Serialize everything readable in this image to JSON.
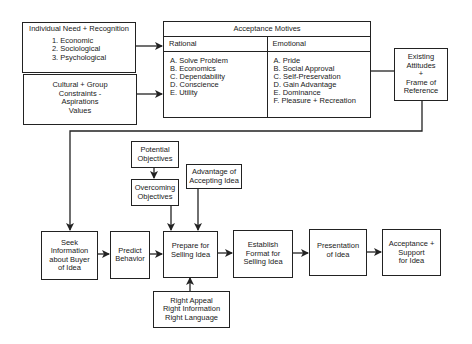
{
  "individual_need": {
    "title": "Individual Need + Recognition",
    "items": [
      "1.  Economic",
      "2.  Sociological",
      "3.  Psychological"
    ]
  },
  "cultural_group": {
    "lines": [
      "Cultural + Group",
      "Constraints -",
      "Aspirations",
      "Values"
    ]
  },
  "acceptance_motives": {
    "title": "Acceptance Motives",
    "rational": {
      "header": "Rational",
      "items": [
        "A.  Solve Problem",
        "B.  Economics",
        "C.  Dependability",
        "D.  Conscience",
        "E.  Utility"
      ]
    },
    "emotional": {
      "header": "Emotional",
      "items": [
        "A. Pride",
        "B. Social Approval",
        "C. Self-Preservation",
        "D. Gain Advantage",
        "E.  Dominance",
        "F.  Pleasure + Recreation"
      ]
    }
  },
  "existing_attitudes": {
    "lines": [
      "Existing",
      "Attitudes",
      "+",
      "Frame of",
      "Reference"
    ]
  },
  "potential_objectives": {
    "lines": [
      "Potential",
      "Objectives"
    ]
  },
  "overcoming_objectives": {
    "lines": [
      "Overcoming",
      "Objectives"
    ]
  },
  "advantage": {
    "lines": [
      "Advantage of",
      "Accepting Idea"
    ]
  },
  "flow": {
    "seek": [
      "Seek",
      "Information",
      "about Buyer",
      "of Idea"
    ],
    "predict": [
      "Predict",
      "Behavior"
    ],
    "prepare": [
      "Prepare for",
      "Selling Idea"
    ],
    "establish": [
      "Establish",
      "Format for",
      "Selling Idea"
    ],
    "presentation": [
      "Presentation",
      "of Idea"
    ],
    "acceptance": [
      "Acceptance +",
      "Support",
      "for Idea"
    ]
  },
  "right_box": {
    "lines": [
      "Right Appeal",
      "Right Information",
      "Right Language"
    ]
  },
  "colors": {
    "line": "#222222",
    "background": "#ffffff"
  }
}
